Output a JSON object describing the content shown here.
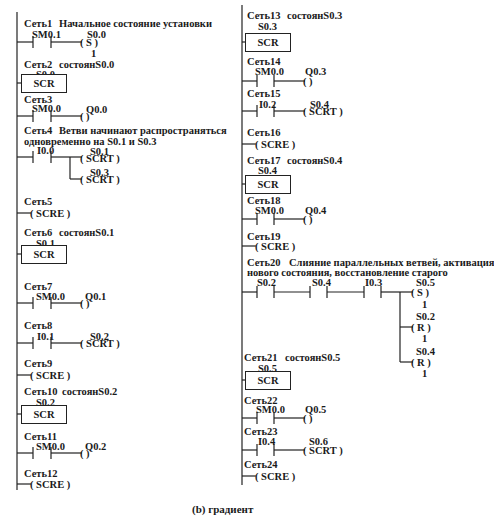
{
  "caption": "(b) градиент",
  "left_column": {
    "networks": [
      {
        "id": "net1",
        "label": "Сеть1",
        "comment": "Начальное состояние установки",
        "contact": "SM0.1",
        "coil_addr": "S0.0",
        "coil": "( S )",
        "coil_n": "1"
      },
      {
        "id": "net2",
        "label": "Сеть2",
        "comment": "состоянS0.0",
        "box_addr": "S0.0",
        "box": "SCR"
      },
      {
        "id": "net3",
        "label": "Сеть3",
        "contact": "SM0.0",
        "coil_addr": "Q0.0",
        "coil": "(    )"
      },
      {
        "id": "net4",
        "label": "Сеть4",
        "comment_line1": "Ветви начинают распространяться",
        "comment_line2": "одновременно на S0.1 и S0.3",
        "contact": "I0.0",
        "coil1_addr": "S0.1",
        "coil1": "( SCRT )",
        "coil2_addr": "S0.3",
        "coil2": "( SCRT )"
      },
      {
        "id": "net5",
        "label": "Сеть5",
        "coil": "( SCRE )"
      },
      {
        "id": "net6",
        "label": "Сеть6",
        "comment": "состоянS0.1",
        "box_addr": "S0.1",
        "box": "SCR"
      },
      {
        "id": "net7",
        "label": "Сеть7",
        "contact": "SM0.0",
        "coil_addr": "Q0.1",
        "coil": "(    )"
      },
      {
        "id": "net8",
        "label": "Сеть8",
        "contact": "I0.1",
        "coil_addr": "S0.2",
        "coil": "( SCRT )"
      },
      {
        "id": "net9",
        "label": "Сеть9",
        "coil": "( SCRE )"
      },
      {
        "id": "net10",
        "label": "Сеть10",
        "comment": "состоянS0.2",
        "box_addr": "S0.2",
        "box": "SCR"
      },
      {
        "id": "net11",
        "label": "Сеть11",
        "contact": "SM0.0",
        "coil_addr": "Q0.2",
        "coil": "(    )"
      },
      {
        "id": "net12",
        "label": "Сеть12",
        "coil": "( SCRE )"
      }
    ]
  },
  "right_column": {
    "networks": [
      {
        "id": "net13",
        "label": "Сеть13",
        "comment": "состоянS0.3",
        "box_addr": "S0.3",
        "box": "SCR"
      },
      {
        "id": "net14",
        "label": "Сеть14",
        "contact": "SM0.0",
        "coil_addr": "Q0.3",
        "coil": "(    )"
      },
      {
        "id": "net15",
        "label": "Сеть15",
        "contact": "I0.2",
        "coil_addr": "S0.4",
        "coil": "( SCRT )"
      },
      {
        "id": "net16",
        "label": "Сеть16",
        "coil": "( SCRE )"
      },
      {
        "id": "net17",
        "label": "Сеть17",
        "comment": "состоянS0.4",
        "box_addr": "S0.4",
        "box": "SCR"
      },
      {
        "id": "net18",
        "label": "Сеть18",
        "contact": "SM0.0",
        "coil_addr": "Q0.4",
        "coil": "(    )"
      },
      {
        "id": "net19",
        "label": "Сеть19",
        "coil": "( SCRE )"
      },
      {
        "id": "net20",
        "label": "Сеть20",
        "comment_line1": "Слияние параллельных ветвей, активация",
        "comment_line2": "нового состояния, восстановление старого",
        "contacts": [
          "S0.2",
          "S0.4",
          "I0.3"
        ],
        "coil1_addr": "S0.5",
        "coil1": "( S )",
        "coil1_n": "1",
        "coil2_addr": "S0.2",
        "coil2": "( R )",
        "coil2_n": "1",
        "coil3_addr": "S0.4",
        "coil3": "( R )",
        "coil3_n": "1"
      },
      {
        "id": "net21",
        "label": "Сеть21",
        "comment": "состоянS0.5",
        "box_addr": "S0.5",
        "box": "SCR"
      },
      {
        "id": "net22",
        "label": "Сеть22",
        "contact": "SM0.0",
        "coil_addr": "Q0.5",
        "coil": "(    )"
      },
      {
        "id": "net23",
        "label": "Сеть23",
        "contact": "I0.4",
        "coil_addr": "S0.6",
        "coil": "( SCRT )"
      },
      {
        "id": "net24",
        "label": "Сеть24",
        "coil": "( SCRE )"
      }
    ]
  }
}
